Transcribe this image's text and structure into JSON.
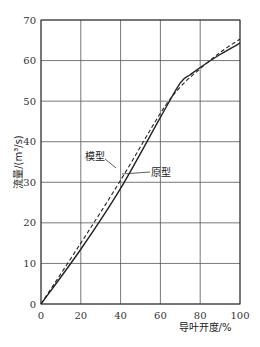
{
  "chart_data": {
    "type": "line",
    "title": "",
    "xlabel": "导叶开度/%",
    "ylabel": "流量/(m³/s)",
    "xlim": [
      0,
      100
    ],
    "ylim": [
      0,
      70
    ],
    "xticks": [
      0,
      20,
      40,
      60,
      80,
      100
    ],
    "yticks": [
      0,
      10,
      20,
      30,
      40,
      50,
      60,
      70
    ],
    "grid": true,
    "legend_position": "inline annotations",
    "series": [
      {
        "name": "模型",
        "style": "dashed",
        "x": [
          0,
          20,
          40,
          60,
          70,
          80,
          90,
          100
        ],
        "y": [
          0,
          15,
          30.5,
          47,
          53.5,
          58,
          62,
          65.3
        ]
      },
      {
        "name": "原型",
        "style": "solid",
        "x": [
          0,
          20,
          40,
          60,
          70,
          75,
          80,
          90,
          100
        ],
        "y": [
          0,
          13.5,
          28.5,
          46,
          54.5,
          56.5,
          58.3,
          61.5,
          64.3
        ]
      }
    ],
    "annotations": [
      {
        "text": "模型",
        "x": 32,
        "y": 37
      },
      {
        "text": "原型",
        "x": 55,
        "y": 33
      }
    ]
  },
  "axes": {
    "xlabel": "导叶开度/%",
    "ylabel": "流量/(m³/s)",
    "xticks": [
      "0",
      "20",
      "40",
      "60",
      "80",
      "100"
    ],
    "yticks": [
      "0",
      "10",
      "20",
      "30",
      "40",
      "50",
      "60",
      "70"
    ]
  },
  "labels": {
    "model": "模型",
    "prototype": "原型"
  },
  "colors": {
    "line": "#222222",
    "grid": "#555555"
  }
}
